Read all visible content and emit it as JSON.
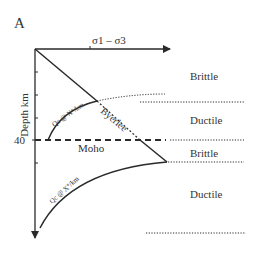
{
  "figure": {
    "panel_label": "A",
    "x_axis_label": "σ1 – σ3",
    "y_axis_label": "Depth km",
    "depth_tick_label": "40",
    "moho_label": "Moho",
    "byerlee_label": "Byerlee",
    "curve_upper_label": "Qc @ X°/km",
    "curve_lower_label": "Qc @ X°/km",
    "zones": [
      {
        "label": "Brittle"
      },
      {
        "label": "Ductile"
      },
      {
        "label": "Brittle"
      },
      {
        "label": "Ductile"
      }
    ],
    "colors": {
      "line": "#2a2a2a",
      "text": "#333333",
      "background": "#ffffff"
    }
  }
}
